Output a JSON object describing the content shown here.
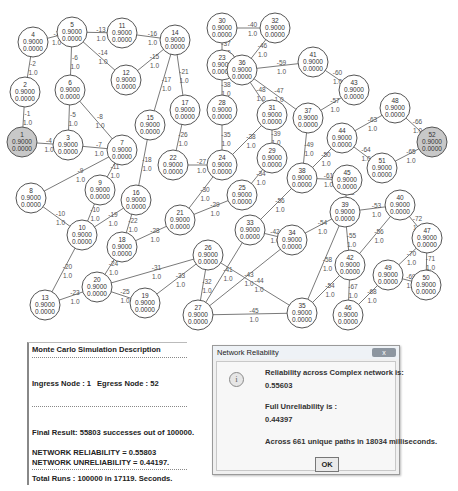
{
  "graph": {
    "node_reliability_label": "0.9000",
    "node_sub_label": "0.0000",
    "source_node": 1,
    "sink_node": 52,
    "highlight_color": "#c8c8c8",
    "nodes": [
      {
        "id": 1,
        "x": 22,
        "y": 142,
        "highlight": true
      },
      {
        "id": 2,
        "x": 25,
        "y": 92
      },
      {
        "id": 3,
        "x": 68,
        "y": 145
      },
      {
        "id": 4,
        "x": 33,
        "y": 42
      },
      {
        "id": 5,
        "x": 72,
        "y": 32
      },
      {
        "id": 6,
        "x": 70,
        "y": 90
      },
      {
        "id": 7,
        "x": 122,
        "y": 150
      },
      {
        "id": 8,
        "x": 31,
        "y": 198
      },
      {
        "id": 9,
        "x": 100,
        "y": 190
      },
      {
        "id": 10,
        "x": 82,
        "y": 235
      },
      {
        "id": 11,
        "x": 122,
        "y": 33
      },
      {
        "id": 12,
        "x": 126,
        "y": 80
      },
      {
        "id": 13,
        "x": 45,
        "y": 305
      },
      {
        "id": 14,
        "x": 175,
        "y": 40
      },
      {
        "id": 15,
        "x": 150,
        "y": 125
      },
      {
        "id": 16,
        "x": 136,
        "y": 200
      },
      {
        "id": 17,
        "x": 185,
        "y": 110
      },
      {
        "id": 18,
        "x": 122,
        "y": 247
      },
      {
        "id": 19,
        "x": 145,
        "y": 303
      },
      {
        "id": 20,
        "x": 97,
        "y": 287
      },
      {
        "id": 21,
        "x": 180,
        "y": 220
      },
      {
        "id": 22,
        "x": 173,
        "y": 165
      },
      {
        "id": 23,
        "x": 222,
        "y": 65
      },
      {
        "id": 24,
        "x": 222,
        "y": 165
      },
      {
        "id": 25,
        "x": 242,
        "y": 195
      },
      {
        "id": 26,
        "x": 208,
        "y": 255
      },
      {
        "id": 27,
        "x": 198,
        "y": 315
      },
      {
        "id": 28,
        "x": 222,
        "y": 110
      },
      {
        "id": 29,
        "x": 272,
        "y": 158
      },
      {
        "id": 30,
        "x": 222,
        "y": 28
      },
      {
        "id": 31,
        "x": 272,
        "y": 115
      },
      {
        "id": 32,
        "x": 275,
        "y": 28
      },
      {
        "id": 33,
        "x": 250,
        "y": 230
      },
      {
        "id": 34,
        "x": 292,
        "y": 240
      },
      {
        "id": 35,
        "x": 302,
        "y": 313
      },
      {
        "id": 36,
        "x": 242,
        "y": 70
      },
      {
        "id": 37,
        "x": 308,
        "y": 118
      },
      {
        "id": 38,
        "x": 302,
        "y": 178
      },
      {
        "id": 39,
        "x": 345,
        "y": 212
      },
      {
        "id": 40,
        "x": 400,
        "y": 205
      },
      {
        "id": 41,
        "x": 313,
        "y": 62
      },
      {
        "id": 42,
        "x": 350,
        "y": 265
      },
      {
        "id": 43,
        "x": 354,
        "y": 90
      },
      {
        "id": 44,
        "x": 342,
        "y": 138
      },
      {
        "id": 45,
        "x": 347,
        "y": 180
      },
      {
        "id": 46,
        "x": 348,
        "y": 315
      },
      {
        "id": 47,
        "x": 427,
        "y": 238
      },
      {
        "id": 48,
        "x": 395,
        "y": 108
      },
      {
        "id": 49,
        "x": 388,
        "y": 275
      },
      {
        "id": 50,
        "x": 426,
        "y": 285
      },
      {
        "id": 51,
        "x": 382,
        "y": 168
      },
      {
        "id": 52,
        "x": 432,
        "y": 142,
        "highlight": true
      }
    ],
    "edges": [
      {
        "a": 1,
        "b": 2,
        "label": "-1",
        "w": "1.0"
      },
      {
        "a": 1,
        "b": 3,
        "label": "-4",
        "w": "1.0"
      },
      {
        "a": 2,
        "b": 4,
        "label": "-2",
        "w": "1.0"
      },
      {
        "a": 4,
        "b": 5,
        "label": "-3",
        "w": "1.0"
      },
      {
        "a": 5,
        "b": 6,
        "label": "-6",
        "w": "1.0"
      },
      {
        "a": 5,
        "b": 11,
        "label": "-13",
        "w": "1.0"
      },
      {
        "a": 5,
        "b": 12,
        "label": "-14",
        "w": "1.0"
      },
      {
        "a": 6,
        "b": 3,
        "label": "-5",
        "w": "1.0"
      },
      {
        "a": 6,
        "b": 7,
        "label": "-8",
        "w": "1.0"
      },
      {
        "a": 3,
        "b": 7,
        "label": "-7",
        "w": "1.0"
      },
      {
        "a": 7,
        "b": 8,
        "label": "-9",
        "w": "1.0"
      },
      {
        "a": 7,
        "b": 9,
        "label": "-11",
        "w": "1.0"
      },
      {
        "a": 11,
        "b": 14,
        "label": "-16",
        "w": "1.0"
      },
      {
        "a": 12,
        "b": 14,
        "label": "-15",
        "w": "1.0"
      },
      {
        "a": 14,
        "b": 15,
        "label": "-17",
        "w": "1.0"
      },
      {
        "a": 14,
        "b": 17,
        "label": "-21",
        "w": "1.0"
      },
      {
        "a": 8,
        "b": 10,
        "label": "-10",
        "w": "1.0"
      },
      {
        "a": 9,
        "b": 10,
        "label": "-10",
        "w": "1.0"
      },
      {
        "a": 10,
        "b": 16,
        "label": "-19",
        "w": "1.0"
      },
      {
        "a": 15,
        "b": 16,
        "label": "-18",
        "w": "1.0"
      },
      {
        "a": 16,
        "b": 18,
        "label": "-22",
        "w": "1.0"
      },
      {
        "a": 17,
        "b": 22,
        "label": "-26",
        "w": "1.0"
      },
      {
        "a": 10,
        "b": 13,
        "label": "-20",
        "w": "1.0"
      },
      {
        "a": 13,
        "b": 20,
        "label": "-23",
        "w": "1.0"
      },
      {
        "a": 18,
        "b": 20,
        "label": "-24",
        "w": "1.0"
      },
      {
        "a": 18,
        "b": 21,
        "label": "-28",
        "w": "1.0"
      },
      {
        "a": 20,
        "b": 19,
        "label": "-25",
        "w": "1.0"
      },
      {
        "a": 20,
        "b": 26,
        "label": "-31",
        "w": "1.0"
      },
      {
        "a": 19,
        "b": 26,
        "label": "-33",
        "w": "1.0"
      },
      {
        "a": 22,
        "b": 24,
        "label": "-27",
        "w": "1.0"
      },
      {
        "a": 21,
        "b": 24,
        "label": "-30",
        "w": "1.0"
      },
      {
        "a": 21,
        "b": 25,
        "label": "-29",
        "w": "1.0"
      },
      {
        "a": 30,
        "b": 32,
        "label": "-40",
        "w": "1.0"
      },
      {
        "a": 30,
        "b": 23,
        "label": "-37",
        "w": "1.0"
      },
      {
        "a": 23,
        "b": 28,
        "label": "-38",
        "w": "1.0"
      },
      {
        "a": 28,
        "b": 24,
        "label": "-35",
        "w": "1.0"
      },
      {
        "a": 32,
        "b": 36,
        "label": "-46",
        "w": "1.0"
      },
      {
        "a": 36,
        "b": 41,
        "label": "-59",
        "w": "1.0"
      },
      {
        "a": 36,
        "b": 31,
        "label": "-48",
        "w": "1.0"
      },
      {
        "a": 36,
        "b": 37,
        "label": "-47",
        "w": "1.0"
      },
      {
        "a": 31,
        "b": 24,
        "label": "-38",
        "w": "1.0"
      },
      {
        "a": 31,
        "b": 29,
        "label": "-39",
        "w": "1.0"
      },
      {
        "a": 29,
        "b": 25,
        "label": "-34",
        "w": "1.0"
      },
      {
        "a": 41,
        "b": 43,
        "label": "-60",
        "w": "1.0"
      },
      {
        "a": 43,
        "b": 37,
        "label": "-57",
        "w": "1.0"
      },
      {
        "a": 37,
        "b": 38,
        "label": "-49",
        "w": "1.0"
      },
      {
        "a": 44,
        "b": 38,
        "label": "-50",
        "w": "1.0"
      },
      {
        "a": 44,
        "b": 48,
        "label": "-63",
        "w": "1.0"
      },
      {
        "a": 44,
        "b": 51,
        "label": "-64",
        "w": "1.0"
      },
      {
        "a": 48,
        "b": 52,
        "label": "-66",
        "w": "1.0"
      },
      {
        "a": 51,
        "b": 52,
        "label": "-65",
        "w": "1.0"
      },
      {
        "a": 38,
        "b": 45,
        "label": "-61",
        "w": "1.0"
      },
      {
        "a": 38,
        "b": 33,
        "label": "-56",
        "w": "1.0"
      },
      {
        "a": 45,
        "b": 39,
        "label": "-62",
        "w": "1.0"
      },
      {
        "a": 39,
        "b": 40,
        "label": "-53",
        "w": "1.0"
      },
      {
        "a": 39,
        "b": 34,
        "label": "-54",
        "w": "1.0"
      },
      {
        "a": 39,
        "b": 42,
        "label": "-55",
        "w": "1.0"
      },
      {
        "a": 39,
        "b": 35,
        "label": "-58",
        "w": "1.0"
      },
      {
        "a": 40,
        "b": 42,
        "label": "-56",
        "w": "1.0"
      },
      {
        "a": 40,
        "b": 47,
        "label": "-72",
        "w": "1.0"
      },
      {
        "a": 47,
        "b": 49,
        "label": "-70",
        "w": "1.0"
      },
      {
        "a": 47,
        "b": 50,
        "label": "-71",
        "w": "1.0"
      },
      {
        "a": 49,
        "b": 50,
        "label": "-69",
        "w": "1.0"
      },
      {
        "a": 49,
        "b": 46,
        "label": "-68",
        "w": "1.0"
      },
      {
        "a": 42,
        "b": 46,
        "label": "-67",
        "w": "1.0"
      },
      {
        "a": 42,
        "b": 35,
        "label": "-54",
        "w": "1.0"
      },
      {
        "a": 33,
        "b": 34,
        "label": "-42",
        "w": "1.0"
      },
      {
        "a": 33,
        "b": 27,
        "label": "-41",
        "w": "1.0"
      },
      {
        "a": 34,
        "b": 27,
        "label": "-43",
        "w": "1.0"
      },
      {
        "a": 26,
        "b": 27,
        "label": "-32",
        "w": "1.0"
      },
      {
        "a": 26,
        "b": 35,
        "label": "-44",
        "w": "1.0"
      },
      {
        "a": 27,
        "b": 35,
        "label": "-45",
        "w": "1.0"
      }
    ]
  },
  "simulation_panel": {
    "title": "Monte Carlo Simulation Description",
    "ingress_label": "Ingress Node : 1",
    "egress_label": "Egress Node   : 52",
    "final_result": "Final Result: 55803 successes out of 100000.",
    "network_reliability": "NETWORK RELIABILITY = 0.55803",
    "network_unreliability": "NETWORK UNRELIABILITY = 0.44197.",
    "total_runs": "Total Runs   : 100000 in 17119. Seconds."
  },
  "dialog": {
    "title": "Network Reliability",
    "close_label": "x",
    "info_icon_glyph": "i",
    "reliability_label": "Reliability across Complex network is:",
    "reliability_value": "0.55603",
    "unreliability_label": "Full Unreliability is :",
    "unreliability_value": "0.44397",
    "paths_text": "Across 661 unique paths in 18034 milliseconds.",
    "ok_label": "OK"
  }
}
